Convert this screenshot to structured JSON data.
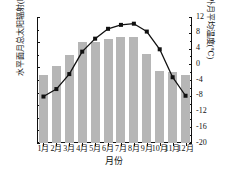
{
  "chart_data": {
    "type": "bar",
    "title": "",
    "xlabel": "月份",
    "categories": [
      "1月",
      "2月",
      "3月",
      "4月",
      "5月",
      "6月",
      "7月",
      "8月",
      "9月",
      "10月",
      "11月",
      "12月"
    ],
    "series": [
      {
        "name": "水平面月总太阳辐射",
        "type": "bar",
        "axis": "left",
        "unit": "kWh/m²",
        "values": [
          108,
          123,
          140,
          161,
          160,
          165,
          168,
          169,
          142,
          115,
          113,
          108
        ],
        "color": "#b6b6b6"
      },
      {
        "name": "室外月平均温度",
        "type": "line",
        "axis": "right",
        "unit": "℃",
        "values": [
          -8.2,
          -6.3,
          -2.5,
          3.2,
          6.5,
          9.0,
          10.0,
          10.3,
          8.3,
          3.8,
          -3.3,
          -8.0
        ],
        "color": "#111111",
        "marker": "square"
      }
    ],
    "left_axis": {
      "label": "水平面月总太阳辐射(kWh/m²)",
      "ylim": [
        0,
        200
      ],
      "ticks": [
        0,
        40,
        80,
        120,
        160,
        200
      ],
      "tick_labels": [
        "0",
        "40",
        "80",
        "120",
        "160",
        "200"
      ],
      "minor_ticks": [
        20,
        60,
        100,
        140,
        180
      ]
    },
    "right_axis": {
      "label": "室外月平均温度(℃)",
      "ylim": [
        -20,
        12
      ],
      "ticks": [
        -20,
        -16,
        -12,
        -8,
        -4,
        0,
        4,
        8,
        12
      ],
      "tick_labels": [
        "-20",
        "-16",
        "-12",
        "-8",
        "-4",
        "0",
        "4",
        "8",
        "12"
      ],
      "minor_ticks": [
        -18,
        -14,
        -10,
        -6,
        -2,
        2,
        6,
        10
      ]
    },
    "grid": false,
    "legend": null
  }
}
